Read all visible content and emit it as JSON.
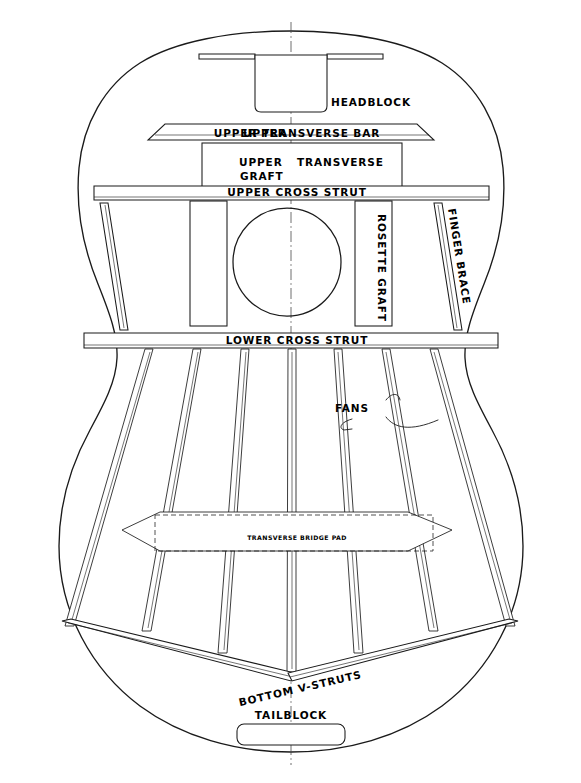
{
  "drawing": {
    "title": "Classical Guitar Soundboard Bracing Plan",
    "subject": "guitar-top-bracing-layout",
    "line_color": "#1a1a1a",
    "background_color": "#ffffff",
    "centerline_color": "#4a4a4a"
  },
  "labels": {
    "headblock": "HEADBLOCK",
    "upper_transverse_bar": "UPPER TRANSVERSE BAR",
    "upper_graft_line1": "UPPER",
    "upper_graft_line2": "GRAFT",
    "upper_transverse": "TRANSVERSE",
    "upper_cross_strut": "UPPER CROSS STRUT",
    "rosette_graft": "ROSETTE GRAFT",
    "finger_brace": "FINGER BRACE",
    "lower_cross_strut": "LOWER CROSS STRUT",
    "fans": "FANS",
    "transverse_bridge_pad": "TRANSVERSE BRIDGE PAD",
    "bottom_v_struts": "BOTTOM V-STRUTS",
    "tailblock": "TAILBLOCK"
  },
  "components": {
    "fan_strut_count": 7,
    "finger_brace_count": 2,
    "rosette_graft_count": 2,
    "cross_strut_count": 2,
    "v_strut_count": 2,
    "soundhole_shape": "circle",
    "bridge_pad_shape": "elongated-hexagon"
  }
}
